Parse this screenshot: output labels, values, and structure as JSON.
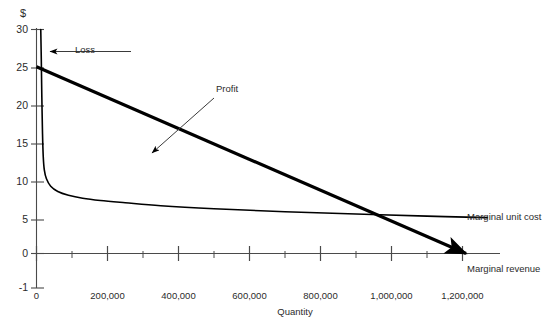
{
  "chart_data": {
    "type": "line",
    "title": "",
    "xlabel": "Quantity",
    "ylabel": "$",
    "xlim": [
      0,
      1270000
    ],
    "ylim": [
      -1,
      30
    ],
    "grid": false,
    "legend_position": "right-inline",
    "y_ticks": [
      {
        "value": 30,
        "label": "30"
      },
      {
        "value": 25,
        "label": "25"
      },
      {
        "value": 20,
        "label": "20"
      },
      {
        "value": 15,
        "label": "15"
      },
      {
        "value": 10,
        "label": "10"
      },
      {
        "value": 5,
        "label": "5"
      },
      {
        "value": 0,
        "label": "0"
      },
      {
        "value": -1,
        "label": "-1"
      }
    ],
    "x_ticks": [
      {
        "value": 0,
        "label": "0",
        "major": true
      },
      {
        "value": 100000,
        "label": "",
        "major": false
      },
      {
        "value": 200000,
        "label": "200,000",
        "major": true
      },
      {
        "value": 300000,
        "label": "",
        "major": false
      },
      {
        "value": 400000,
        "label": "400,000",
        "major": true
      },
      {
        "value": 500000,
        "label": "",
        "major": false
      },
      {
        "value": 600000,
        "label": "600,000",
        "major": true
      },
      {
        "value": 700000,
        "label": "",
        "major": false
      },
      {
        "value": 800000,
        "label": "800,000",
        "major": true
      },
      {
        "value": 900000,
        "label": "",
        "major": false
      },
      {
        "value": 1000000,
        "label": "1,000,000",
        "major": true
      },
      {
        "value": 1100000,
        "label": "",
        "major": false
      },
      {
        "value": 1200000,
        "label": "1,200,000",
        "major": true
      }
    ],
    "series": [
      {
        "name": "Marginal unit cost",
        "label": "Marginal unit cost",
        "color": "#000000",
        "width": 1.6,
        "points": [
          [
            12000,
            30.0
          ],
          [
            13500,
            26.0
          ],
          [
            15000,
            21.0
          ],
          [
            17000,
            16.0
          ],
          [
            19000,
            13.0
          ],
          [
            22000,
            11.2
          ],
          [
            28000,
            10.0
          ],
          [
            40000,
            9.0
          ],
          [
            60000,
            8.3
          ],
          [
            90000,
            7.8
          ],
          [
            130000,
            7.4
          ],
          [
            180000,
            7.1
          ],
          [
            250000,
            6.8
          ],
          [
            350000,
            6.4
          ],
          [
            500000,
            6.0
          ],
          [
            700000,
            5.6
          ],
          [
            900000,
            5.3
          ],
          [
            1100000,
            5.0
          ],
          [
            1270000,
            4.8
          ]
        ]
      },
      {
        "name": "Marginal revenue",
        "label": "Marginal revenue",
        "color": "#000000",
        "width": 3.2,
        "points": [
          [
            0,
            25.0
          ],
          [
            1210000,
            0.0
          ]
        ]
      }
    ],
    "annotations": [
      {
        "name": "loss",
        "text": "Loss",
        "text_x": 75,
        "text_y": 48,
        "arrow_from": [
          130,
          52
        ],
        "arrow_to": [
          45,
          52
        ]
      },
      {
        "name": "profit",
        "text": "Profit",
        "text_x": 215,
        "text_y": 88,
        "arrow_from": [
          213,
          99
        ],
        "arrow_to": [
          150,
          155
        ]
      }
    ]
  },
  "labels": {
    "y_axis_unit": "$",
    "x_axis_title": "Quantity",
    "marginal_unit_cost": "Marginal unit cost",
    "marginal_revenue": "Marginal revenue",
    "loss": "Loss",
    "profit": "Profit",
    "y30": "30",
    "y25": "25",
    "y20": "20",
    "y15": "15",
    "y10": "10",
    "y5": "5",
    "y0": "0",
    "ym1": "-1",
    "x0": "0",
    "x200k": "200,000",
    "x400k": "400,000",
    "x600k": "600,000",
    "x800k": "800,000",
    "x1000k": "1,000,000",
    "x1200k": "1,200,000"
  },
  "colors": {
    "line": "#000000",
    "axis": "#4a4a4a",
    "text": "#2b2b2b",
    "background": "#ffffff"
  }
}
